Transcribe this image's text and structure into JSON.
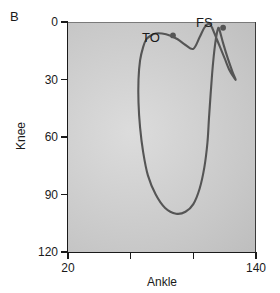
{
  "figure": {
    "panel_label": "B"
  },
  "chart_data": {
    "type": "line",
    "title": "",
    "subtitle": "",
    "xlabel": "Ankle",
    "ylabel": "Knee",
    "xlim": [
      20,
      140
    ],
    "ylim": [
      0,
      120
    ],
    "y_inverted": true,
    "grid": false,
    "legend": "none",
    "x_ticks": [
      20,
      60,
      100,
      140
    ],
    "x_tick_labels": [
      "20",
      "",
      "",
      "140"
    ],
    "y_ticks": [
      0,
      30,
      60,
      90,
      120
    ],
    "y_tick_labels": [
      "0",
      "30",
      "60",
      "90",
      "120"
    ],
    "series": [
      {
        "name": "gait-cyclogram",
        "color": "#555555",
        "closed": true,
        "points": [
          [
            112,
            3
          ],
          [
            110,
            1
          ],
          [
            107,
            3
          ],
          [
            104,
            8
          ],
          [
            100,
            14
          ],
          [
            95,
            12
          ],
          [
            90,
            9
          ],
          [
            85,
            7
          ],
          [
            80,
            6
          ],
          [
            76,
            6
          ],
          [
            73,
            7
          ],
          [
            70,
            9
          ],
          [
            68,
            13
          ],
          [
            66,
            20
          ],
          [
            65,
            30
          ],
          [
            65,
            42
          ],
          [
            66,
            55
          ],
          [
            68,
            68
          ],
          [
            71,
            80
          ],
          [
            76,
            90
          ],
          [
            82,
            97
          ],
          [
            89,
            100
          ],
          [
            95,
            99
          ],
          [
            100,
            95
          ],
          [
            104,
            87
          ],
          [
            107,
            76
          ],
          [
            109,
            63
          ],
          [
            110,
            50
          ],
          [
            111,
            38
          ],
          [
            112,
            27
          ],
          [
            113,
            18
          ],
          [
            114,
            11
          ],
          [
            115,
            6
          ],
          [
            116,
            3
          ],
          [
            117,
            5
          ],
          [
            119,
            11
          ],
          [
            122,
            19
          ],
          [
            125,
            26
          ],
          [
            127,
            30
          ],
          [
            126,
            29
          ],
          [
            123,
            25
          ],
          [
            120,
            19
          ],
          [
            117,
            13
          ],
          [
            114,
            7
          ],
          [
            112,
            3
          ]
        ]
      }
    ],
    "annotations": [
      {
        "name": "toe-off",
        "label": "TO",
        "x": 87,
        "y": 7,
        "marker": "dot",
        "marker_color": "#555555",
        "label_position": "left"
      },
      {
        "name": "foot-strike",
        "label": "FS",
        "x": 119,
        "y": 3,
        "marker": "dot",
        "marker_color": "#555555",
        "label_position": "left"
      }
    ]
  },
  "colors": {
    "curve": "#555555",
    "axis": "#1a1a1a",
    "plot_background_center": "#dcdcdc",
    "plot_background_edge": "#b6b6b6",
    "page_background": "#ffffff"
  }
}
